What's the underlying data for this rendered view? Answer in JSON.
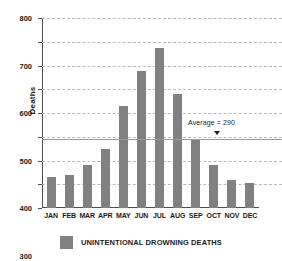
{
  "chart_data": {
    "type": "bar",
    "title": "",
    "subtitle": "",
    "xlabel": "",
    "ylabel": "Deaths",
    "categories": [
      "JAN",
      "FEB",
      "MAR",
      "APR",
      "MAY",
      "JUN",
      "JUL",
      "AUG",
      "SEP",
      "OCT",
      "NOV",
      "DEC"
    ],
    "series": [
      {
        "name": "UNINTENTIONAL DROWNING DEATHS",
        "color": "#818181",
        "values": [
          130,
          140,
          180,
          250,
          430,
          575,
          675,
          480,
          290,
          180,
          120,
          105
        ]
      }
    ],
    "values": [
      130,
      140,
      180,
      250,
      430,
      575,
      675,
      480,
      290,
      180,
      120,
      105
    ],
    "ylim": [
      0,
      800
    ],
    "ytick_step": 100,
    "ytick_labels": [
      "0",
      "100",
      "200",
      "300",
      "400",
      "500",
      "600",
      "700",
      "800"
    ],
    "grid": "horizontal-dashed",
    "legend_position": "bottom-left",
    "annotations": [
      {
        "type": "reference-line",
        "label": "Average = 290",
        "value": 290,
        "marker": "down-triangle"
      }
    ]
  },
  "legend": {
    "items": [
      {
        "label": "UNINTENTIONAL DROWNING DEATHS",
        "color": "#818181"
      }
    ]
  }
}
